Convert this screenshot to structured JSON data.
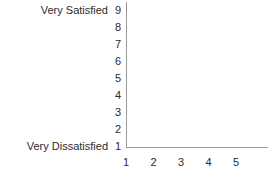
{
  "chart_data": {
    "type": "scatter",
    "title": "",
    "subtitle": "",
    "xlabel": "",
    "ylabel": "",
    "x": [],
    "values": [],
    "series": [],
    "xlim": [
      1,
      5
    ],
    "ylim": [
      1,
      9
    ],
    "x_ticks": [
      "1",
      "2",
      "3",
      "4",
      "5"
    ],
    "y_ticks": [
      "9",
      "8",
      "7",
      "6",
      "5",
      "4",
      "3",
      "2",
      "1"
    ],
    "grid": false,
    "legend": false,
    "legend_position": "none",
    "annotations": [
      {
        "text": "Very Satisfied",
        "anchor": "y-axis-top",
        "value": 9
      },
      {
        "text": "Very Dissatisfied",
        "anchor": "y-axis-bottom",
        "value": 1
      }
    ],
    "note": "Empty axes template with no plotted data points"
  },
  "axis_labels": {
    "y_top_label": "Very Satisfied",
    "y_bottom_label": "Very Dissatisfied"
  },
  "colors": {
    "axis": "#9a9a9a",
    "text": "#2b2b2b",
    "background": "#ffffff"
  }
}
